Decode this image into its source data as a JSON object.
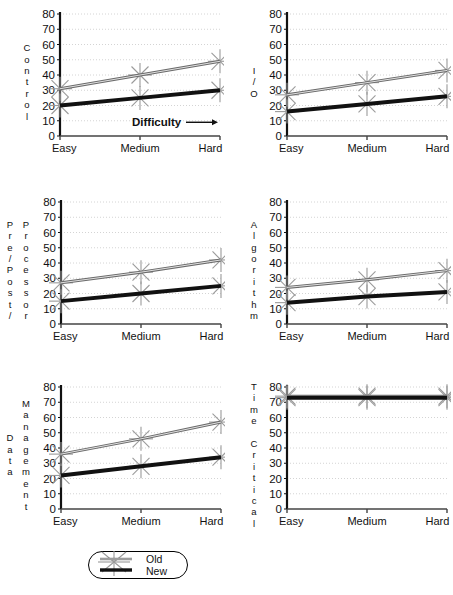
{
  "figure": {
    "x_axis_annotation": "Difficulty",
    "x_axis_arrow": "arrow-right-icon"
  },
  "legend": {
    "items": [
      {
        "label": "Old",
        "style": "thin-gray-line"
      },
      {
        "label": "New",
        "style": "thick-black-line"
      }
    ]
  },
  "colors": {
    "old_series": "#6a6a6a",
    "new_series": "#111111",
    "marker": "#9a9a9a",
    "axis": "#111111",
    "gridline": "#c9c9c9"
  },
  "chart_data": [
    {
      "type": "line",
      "title": "",
      "ylabel_outer": "",
      "ylabel": "Control",
      "xlabel": "Difficulty",
      "categories": [
        "Easy",
        "Medium",
        "Hard"
      ],
      "yticks": [
        0,
        10,
        20,
        30,
        40,
        50,
        60,
        70,
        80
      ],
      "ylim": [
        0,
        80
      ],
      "grid": true,
      "legend_position": "bottom-center-shared",
      "series": [
        {
          "name": "Old",
          "values": [
            31,
            40,
            49
          ]
        },
        {
          "name": "New",
          "values": [
            20,
            25,
            30
          ]
        }
      ]
    },
    {
      "type": "line",
      "title": "",
      "ylabel_outer": "",
      "ylabel": "I/O",
      "xlabel": "",
      "categories": [
        "Easy",
        "Medium",
        "Hard"
      ],
      "yticks": [
        0,
        10,
        20,
        30,
        40,
        50,
        60,
        70,
        80
      ],
      "ylim": [
        0,
        80
      ],
      "grid": true,
      "series": [
        {
          "name": "Old",
          "values": [
            27,
            35,
            43
          ]
        },
        {
          "name": "New",
          "values": [
            16,
            21,
            26
          ]
        }
      ]
    },
    {
      "type": "line",
      "title": "",
      "ylabel_outer": "Pre/Post/",
      "ylabel": "Processor",
      "xlabel": "",
      "categories": [
        "Easy",
        "Medium",
        "Hard"
      ],
      "yticks": [
        0,
        10,
        20,
        30,
        40,
        50,
        60,
        70,
        80
      ],
      "ylim": [
        0,
        80
      ],
      "grid": true,
      "series": [
        {
          "name": "Old",
          "values": [
            27,
            34,
            42
          ]
        },
        {
          "name": "New",
          "values": [
            15,
            20,
            25
          ]
        }
      ]
    },
    {
      "type": "line",
      "title": "",
      "ylabel_outer": "",
      "ylabel": "Algorithm",
      "xlabel": "",
      "categories": [
        "Easy",
        "Medium",
        "Hard"
      ],
      "yticks": [
        0,
        10,
        20,
        30,
        40,
        50,
        60,
        70,
        80
      ],
      "ylim": [
        0,
        80
      ],
      "grid": true,
      "series": [
        {
          "name": "Old",
          "values": [
            24,
            29,
            35
          ]
        },
        {
          "name": "New",
          "values": [
            14,
            18,
            21
          ]
        }
      ]
    },
    {
      "type": "line",
      "title": "",
      "ylabel_outer": "Data",
      "ylabel": "Management",
      "xlabel": "",
      "categories": [
        "Easy",
        "Medium",
        "Hard"
      ],
      "yticks": [
        0,
        10,
        20,
        30,
        40,
        50,
        60,
        70,
        80
      ],
      "ylim": [
        0,
        80
      ],
      "grid": true,
      "series": [
        {
          "name": "Old",
          "values": [
            36,
            46,
            57
          ]
        },
        {
          "name": "New",
          "values": [
            22,
            28,
            34
          ]
        }
      ]
    },
    {
      "type": "line",
      "title": "",
      "ylabel_outer": "",
      "ylabel": "Time Critical",
      "xlabel": "",
      "categories": [
        "Easy",
        "Medium",
        "Hard"
      ],
      "yticks": [
        0,
        10,
        20,
        30,
        40,
        50,
        60,
        70,
        80
      ],
      "ylim": [
        0,
        80
      ],
      "grid": true,
      "series": [
        {
          "name": "Old",
          "values": [
            74,
            74,
            74
          ]
        },
        {
          "name": "New",
          "values": [
            73,
            73,
            73
          ]
        }
      ]
    }
  ]
}
